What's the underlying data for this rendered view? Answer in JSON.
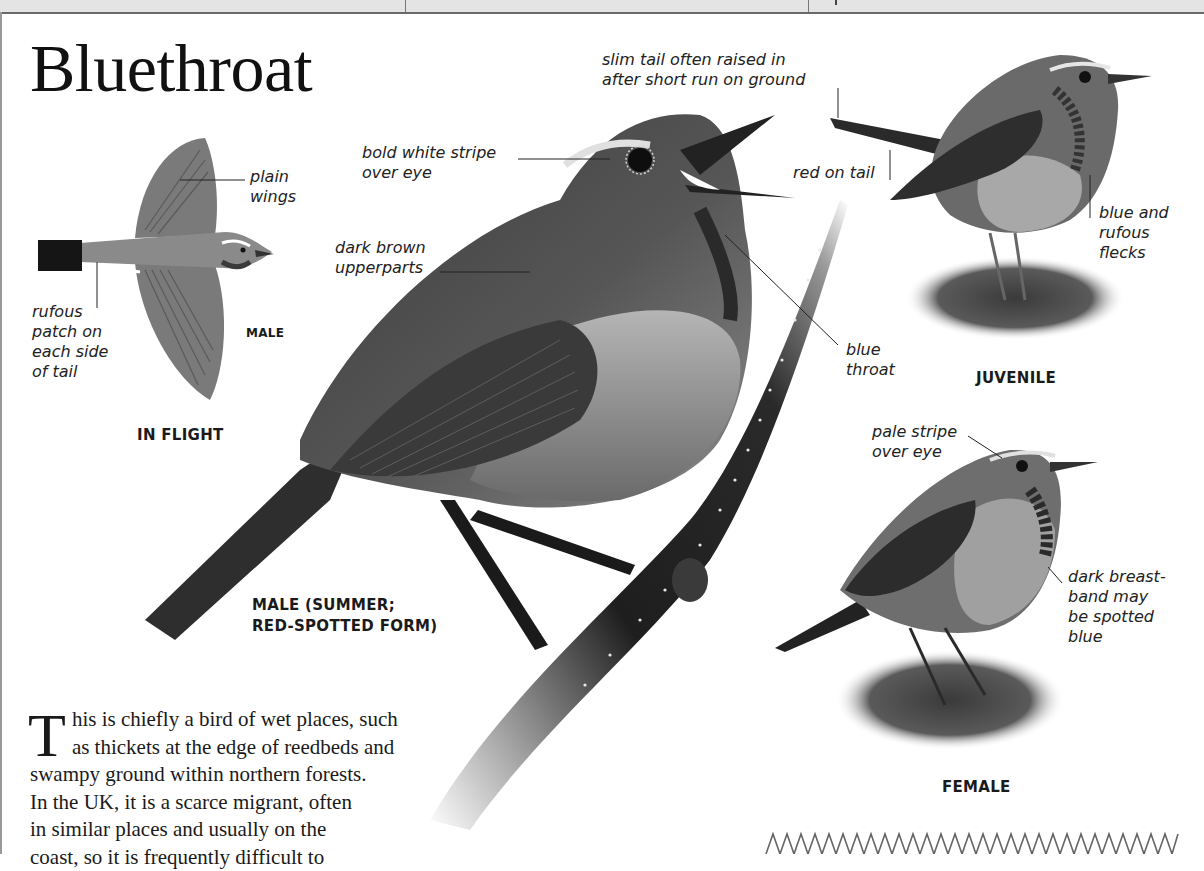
{
  "header_bar": {
    "dividers_x": [
      405,
      808
    ],
    "tick_x": 835
  },
  "page": {
    "title": "Bluethroat",
    "intro": {
      "drop_cap": "T",
      "lines": [
        "his is chiefly a bird of wet places, such",
        "as thickets at the edge of reedbeds and",
        "swampy ground within northern forests.",
        "In the UK, it is a scarce migrant, often",
        "in similar places and usually on the",
        "coast, so it is frequently difficult to"
      ]
    }
  },
  "figures": {
    "in_flight": {
      "caption": "IN FLIGHT",
      "sub_caption": "MALE",
      "annotations": {
        "wings": [
          "plain",
          "wings"
        ],
        "tail": [
          "rufous",
          "patch on",
          "each side",
          "of tail"
        ]
      }
    },
    "male_summer": {
      "caption": [
        "MALE (SUMMER;",
        "RED-SPOTTED FORM)"
      ],
      "annotations": {
        "eye_stripe": [
          "bold white stripe",
          "over eye"
        ],
        "upperparts": [
          "dark brown",
          "upperparts"
        ],
        "throat": [
          "blue",
          "throat"
        ]
      }
    },
    "juvenile": {
      "caption": "JUVENILE",
      "annotations": {
        "tail_raised": [
          "slim tail often raised in",
          "after short run on ground"
        ],
        "red_tail": "red on tail",
        "flecks": [
          "blue and",
          "rufous",
          "flecks"
        ]
      }
    },
    "female": {
      "caption": "FEMALE",
      "annotations": {
        "eye_stripe": [
          "pale stripe",
          "over eye"
        ],
        "breast_band": [
          "dark breast-",
          "band may",
          "be spotted",
          "blue"
        ]
      }
    }
  },
  "colors": {
    "ink": "#1a1a1a",
    "header_bg": "#e4e4e4",
    "header_rule": "#6a6a6a",
    "bird_gray": "#7c7c7c",
    "bird_dark": "#3a3a3a"
  }
}
